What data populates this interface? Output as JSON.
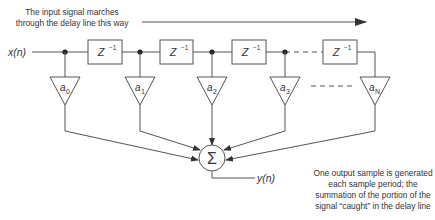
{
  "diagram": {
    "type": "FIR filter / tapped delay line block diagram",
    "annotation_top": {
      "line1": "The input signal marches",
      "line2": "through the delay line this way"
    },
    "input_label": {
      "base": "x(",
      "var": "n",
      "close": ")"
    },
    "output_label": {
      "base": "y(",
      "var": "n",
      "close": ")"
    },
    "delay_blocks": [
      {
        "label": "Z",
        "sup": "−1"
      },
      {
        "label": "Z",
        "sup": "−1"
      },
      {
        "label": "Z",
        "sup": "−1"
      },
      {
        "label": "Z",
        "sup": "−1"
      }
    ],
    "coefficients": [
      {
        "base": "a",
        "sub": "0"
      },
      {
        "base": "a",
        "sub": "1"
      },
      {
        "base": "a",
        "sub": "2"
      },
      {
        "base": "a",
        "sub": "3"
      },
      {
        "base": "a",
        "sub": "N"
      }
    ],
    "summer_symbol": "Σ",
    "annotation_bottom": {
      "line1": "One output sample is generated",
      "line2": "each sample period; the",
      "line3": "summation of the portion of the",
      "line4": "signal “caught” in the delay line"
    },
    "colors": {
      "stroke": "#555555",
      "text": "#333333",
      "background": "#ffffff"
    }
  }
}
